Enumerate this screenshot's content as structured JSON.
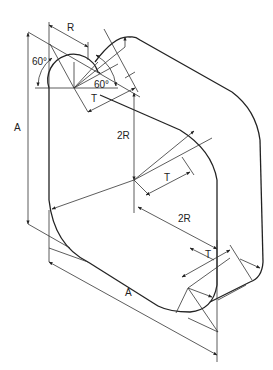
{
  "diagram": {
    "type": "isometric technical drawing",
    "labels": {
      "r_top": "R",
      "angle_left": "60°",
      "angle_right": "60°",
      "t_top": "T",
      "a_left": "A",
      "two_r_vertical": "2R",
      "t_middle": "T",
      "two_r_diagonal": "2R",
      "t_bottom": "T",
      "a_bottom": "A"
    },
    "colors": {
      "line": "#333333",
      "background": "#ffffff"
    }
  }
}
